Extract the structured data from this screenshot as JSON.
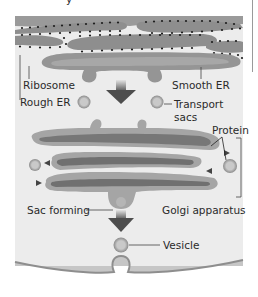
{
  "figure": {
    "title_fragment": "y",
    "background_color": "#ebebeb",
    "membrane_color": "#8e8e8e",
    "lumen_color": "#6f6f6f",
    "ribosome_color": "#1e1e1e",
    "arrow_color": "#555555"
  },
  "labels": {
    "ribosome": "Ribosome",
    "rough_er": "Rough ER",
    "smooth_er": "Smooth ER",
    "transport_sacs_line1": "Transport",
    "transport_sacs_line2": "sacs",
    "protein": "Protein",
    "sac_forming": "Sac forming",
    "golgi_apparatus": "Golgi apparatus",
    "vesicle": "Vesicle"
  },
  "structures": [
    {
      "name": "Rough ER",
      "description": "stacked membranes studded with ribosomes"
    },
    {
      "name": "Smooth ER",
      "description": "tubular extension budding off transport sacs"
    },
    {
      "name": "Transport sacs",
      "count": 2
    },
    {
      "name": "Golgi apparatus",
      "cisternae": 3
    },
    {
      "name": "Vesicle",
      "description": "buds off Golgi and fuses with cell membrane"
    }
  ]
}
